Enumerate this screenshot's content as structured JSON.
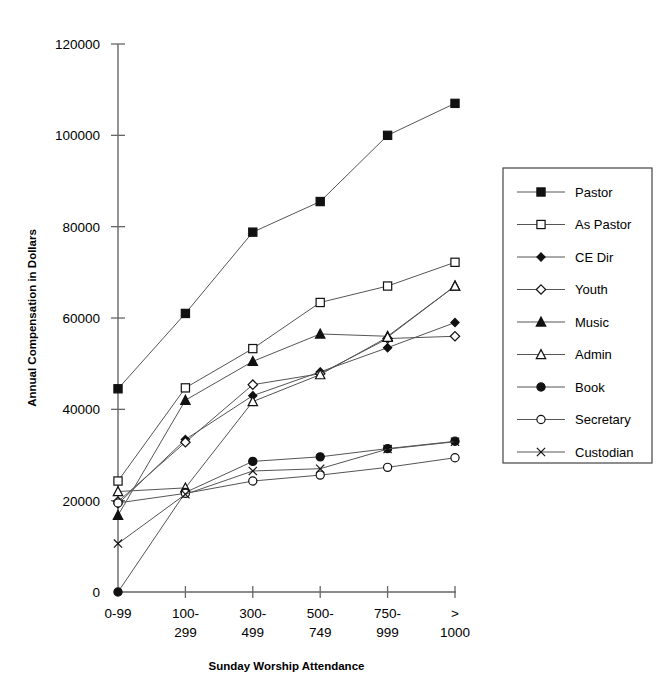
{
  "chart_data": {
    "type": "line",
    "title": "",
    "xlabel": "Sunday Worship Attendance",
    "ylabel": "Annual Compensation in Dollars",
    "categories": [
      "0-99",
      "100-299",
      "300-499",
      "500-749",
      "750-999",
      "> 1000"
    ],
    "category_lines": [
      [
        "0-99"
      ],
      [
        "100-",
        "299"
      ],
      [
        "300-",
        "499"
      ],
      [
        "500-",
        "749"
      ],
      [
        "750-",
        "999"
      ],
      [
        ">",
        "1000"
      ]
    ],
    "ylim": [
      0,
      120000
    ],
    "yticks": [
      0,
      20000,
      40000,
      60000,
      80000,
      100000,
      120000
    ],
    "ytick_labels": [
      "0",
      "20000",
      "40000",
      "60000",
      "80000",
      "100000",
      "120000"
    ],
    "grid": false,
    "legend_position": "right",
    "series": [
      {
        "name": "Pastor",
        "marker": "filled-square",
        "values": [
          44500,
          61000,
          78800,
          85500,
          100000,
          107000
        ]
      },
      {
        "name": "As Pastor",
        "marker": "open-square",
        "values": [
          24300,
          44700,
          53300,
          63400,
          67000,
          72200
        ]
      },
      {
        "name": "CE Dir",
        "marker": "filled-diamond",
        "values": [
          19300,
          33400,
          43000,
          48200,
          53500,
          59000
        ]
      },
      {
        "name": "Youth",
        "marker": "open-diamond",
        "values": [
          19800,
          32800,
          45400,
          47800,
          55500,
          56000
        ]
      },
      {
        "name": "Music",
        "marker": "filled-triangle",
        "values": [
          16800,
          42000,
          50500,
          56500,
          56000,
          67000
        ]
      },
      {
        "name": "Admin",
        "marker": "open-triangle",
        "values": [
          22000,
          22800,
          41700,
          47600,
          55800,
          67000
        ]
      },
      {
        "name": "Book",
        "marker": "filled-circle",
        "values": [
          0,
          21800,
          28600,
          29600,
          31400,
          33000
        ]
      },
      {
        "name": "Secretary",
        "marker": "open-circle",
        "values": [
          19500,
          21600,
          24300,
          25600,
          27300,
          29400
        ]
      },
      {
        "name": "Custodian",
        "marker": "x-mark",
        "values": [
          10600,
          21400,
          26500,
          27000,
          31300,
          32900
        ]
      }
    ]
  },
  "legend": {
    "entries": [
      {
        "label": "Pastor"
      },
      {
        "label": "As Pastor"
      },
      {
        "label": "CE Dir"
      },
      {
        "label": "Youth"
      },
      {
        "label": "Music"
      },
      {
        "label": "Admin"
      },
      {
        "label": "Book"
      },
      {
        "label": "Secretary"
      },
      {
        "label": "Custodian"
      }
    ]
  },
  "colors": {
    "line": "#555555",
    "axis": "#666666",
    "text": "#000000",
    "marker_fill": "#111111",
    "marker_open": "#ffffff",
    "legend_border": "#444444"
  }
}
